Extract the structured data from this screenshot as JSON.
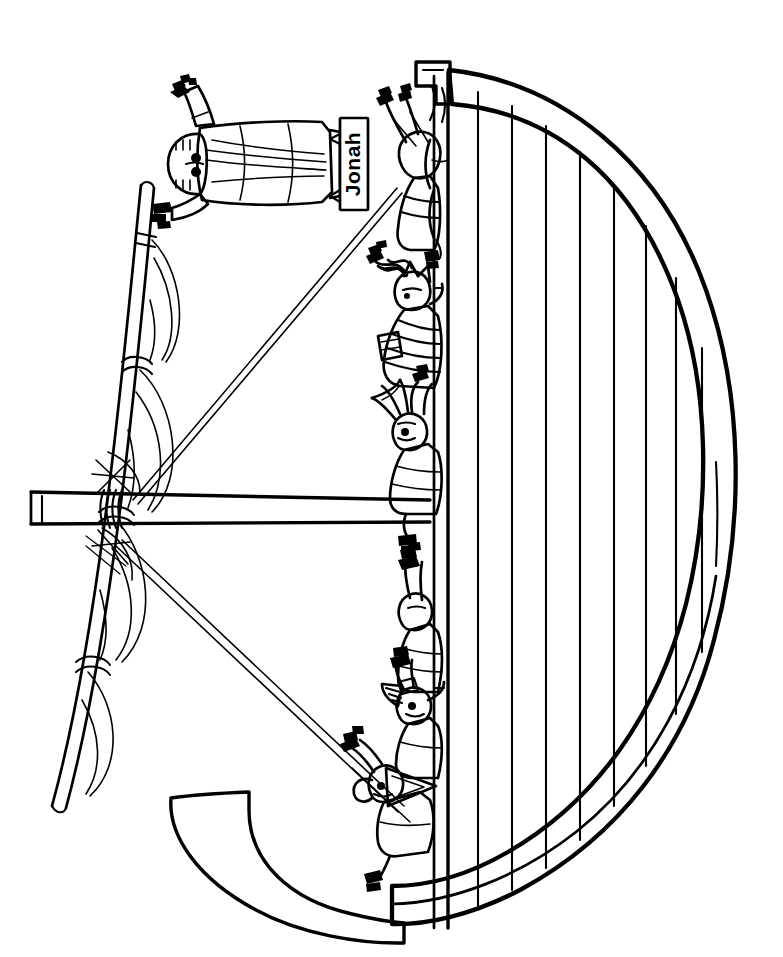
{
  "artwork": {
    "title": "Jonah Thrown From the Ship",
    "type": "line-art-coloring-page",
    "orientation": "rotated-90",
    "canvas": {
      "width": 783,
      "height": 957
    },
    "palette": {
      "ink": "#000000",
      "paper": "#ffffff"
    },
    "labels": {
      "name_sign": "Jonah"
    },
    "elements": {
      "ship_hull_name": "ship-hull",
      "hull_plank_count": 9,
      "mast_name": "mast",
      "yard_name": "yard-spar",
      "furled_sail_name": "furled-sail",
      "rigging_name": "rigging-rope",
      "prow_name": "prow-hook",
      "stern_name": "stern-post",
      "jonah_name": "jonah-figure",
      "sailor_count": 7
    }
  }
}
